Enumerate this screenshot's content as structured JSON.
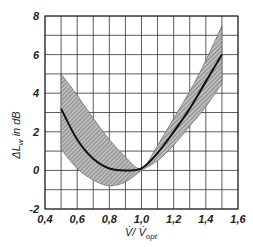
{
  "chart_data": {
    "type": "line",
    "title": "",
    "xlabel": "V̇/ V̇opt",
    "ylabel": "ΔLw in dB",
    "xlim": [
      0.4,
      1.6
    ],
    "ylim": [
      -2,
      8
    ],
    "grid": true,
    "x_ticks": [
      "0,4",
      "0,6",
      "0,8",
      "1,0",
      "1,2",
      "1,4",
      "1,6"
    ],
    "y_ticks": [
      "-2",
      "0",
      "2",
      "4",
      "6",
      "8"
    ],
    "x_tick_values": [
      0.4,
      0.6,
      0.8,
      1.0,
      1.2,
      1.4,
      1.6
    ],
    "y_tick_values": [
      -2,
      0,
      2,
      4,
      6,
      8
    ],
    "x": [
      0.5,
      0.6,
      0.7,
      0.8,
      0.9,
      1.0,
      1.1,
      1.2,
      1.3,
      1.4,
      1.5
    ],
    "series": [
      {
        "name": "mean",
        "values": [
          3.2,
          1.6,
          0.6,
          0.1,
          0.0,
          0.1,
          0.9,
          2.0,
          3.2,
          4.6,
          6.0
        ]
      },
      {
        "name": "upper bound",
        "values": [
          5.0,
          3.9,
          2.7,
          1.6,
          0.7,
          0.1,
          1.3,
          2.7,
          4.1,
          5.7,
          7.5
        ]
      },
      {
        "name": "lower bound",
        "values": [
          1.1,
          0.1,
          -0.5,
          -0.8,
          -0.6,
          0.0,
          0.5,
          1.3,
          2.3,
          3.3,
          4.5
        ]
      }
    ],
    "legend": []
  },
  "labels": {
    "ylabel_main": "ΔL",
    "ylabel_sub": "w",
    "ylabel_rest": " in dB",
    "xlabel_main": "V̇/ V̇",
    "xlabel_sub": "opt"
  },
  "colors": {
    "grid": "#333333",
    "band": "#9a9a9a",
    "curve": "#111111"
  }
}
